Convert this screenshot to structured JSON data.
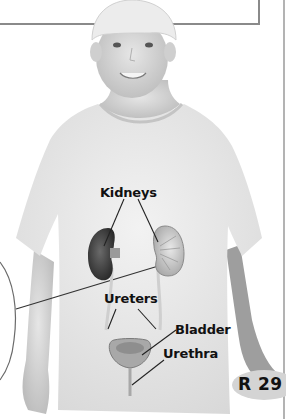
{
  "figure": {
    "system": "urinary-system",
    "colors": {
      "background": "#ffffff",
      "frame_line": "#8a8a8a",
      "label_text": "#111111",
      "leader_line": "#222222",
      "badge_fill": "#d4d4d4"
    }
  },
  "labels": {
    "kidneys": "Kidneys",
    "ureters": "Ureters",
    "bladder": "Bladder",
    "urethra": "Urethra"
  },
  "page_badge": {
    "text": "R 29"
  }
}
